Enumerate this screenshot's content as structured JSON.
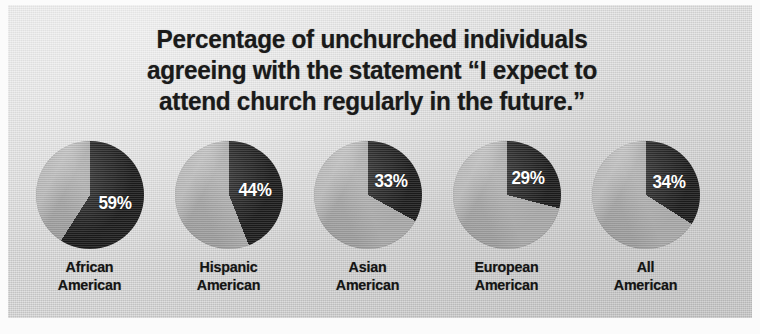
{
  "figure": {
    "title_lines": [
      "Percentage of unchurched individuals",
      "agreeing with the statement “I expect to",
      "attend church regularly in the future.”"
    ],
    "background_color": "#d6d6d6",
    "page_color": "#fbfbfb"
  },
  "colors": {
    "slice_agree": "#1c1c1c",
    "slice_remainder": "#a9a9a9",
    "title_text": "#1a1a1a",
    "label_text": "#141414",
    "percent_text": "#ffffff"
  },
  "chart_data": {
    "type": "pie",
    "title": "Percentage of unchurched individuals agreeing with the statement “I expect to attend church regularly in the future.”",
    "xlabel": "",
    "ylabel": "",
    "units": "percent",
    "legend": "none",
    "grid": false,
    "series_names": [
      "Agree",
      "Did not agree"
    ],
    "categories": [
      "African American",
      "Hispanic American",
      "Asian American",
      "European American",
      "All American"
    ],
    "values": [
      59,
      44,
      33,
      29,
      34
    ],
    "remainder_values": [
      41,
      56,
      67,
      71,
      66
    ],
    "data_labels": [
      "59%",
      "44%",
      "33%",
      "29%",
      "34%"
    ],
    "charts": [
      {
        "label_lines": [
          "African",
          "American"
        ],
        "label": "African American",
        "value": 59,
        "remainder": 41,
        "data_label": "59%"
      },
      {
        "label_lines": [
          "Hispanic",
          "American"
        ],
        "label": "Hispanic American",
        "value": 44,
        "remainder": 56,
        "data_label": "44%"
      },
      {
        "label_lines": [
          "Asian",
          "American"
        ],
        "label": "Asian American",
        "value": 33,
        "remainder": 67,
        "data_label": "33%"
      },
      {
        "label_lines": [
          "European",
          "American"
        ],
        "label": "European American",
        "value": 29,
        "remainder": 71,
        "data_label": "29%"
      },
      {
        "label_lines": [
          "All",
          "American"
        ],
        "label": "All American",
        "value": 34,
        "remainder": 66,
        "data_label": "34%"
      }
    ]
  }
}
